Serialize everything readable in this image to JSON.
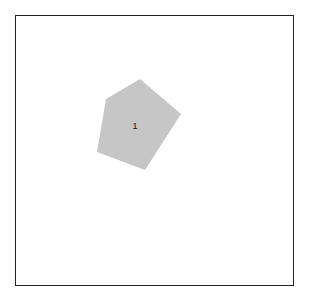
{
  "diagram": {
    "frame": {
      "x": 15,
      "y": 15,
      "width": 279,
      "height": 271,
      "stroke": "#222222"
    },
    "shapes": [
      {
        "id": "1",
        "type": "pentagon",
        "label": "1",
        "fill": "#c6c6c6",
        "points": "140,79 181,114 145,170 97,152 106,99",
        "label_pos": {
          "x": 135,
          "y": 126
        }
      }
    ]
  }
}
